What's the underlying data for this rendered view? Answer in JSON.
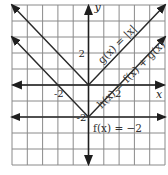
{
  "chart_data": {
    "type": "line",
    "title": "",
    "xlabel": "x",
    "ylabel": "y",
    "xlim": [
      -5,
      5
    ],
    "ylim": [
      -5,
      5
    ],
    "grid": true,
    "grid_step": 1,
    "x_tick_labels": [
      {
        "value": -2,
        "label": "-2"
      },
      {
        "value": 2,
        "label": "2"
      }
    ],
    "y_tick_labels": [
      {
        "value": 2,
        "label": "2"
      },
      {
        "value": -2,
        "label": "-2"
      }
    ],
    "series": [
      {
        "name": "g(x) = |x|",
        "label": "g(x) = |x|",
        "x": [
          -5,
          0,
          5
        ],
        "y": [
          5,
          0,
          5
        ]
      },
      {
        "name": "h(x) = f(x) + g(x)",
        "label": "h(x) = f(x) + g(x)",
        "x": [
          -5,
          0,
          5
        ],
        "y": [
          3,
          -2,
          3
        ]
      },
      {
        "name": "f(x) = -2",
        "label": "f(x) = −2",
        "x": [
          -5,
          5
        ],
        "y": [
          -2,
          -2
        ]
      }
    ]
  }
}
